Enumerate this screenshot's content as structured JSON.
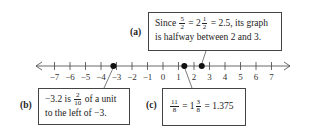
{
  "number_line": {
    "min": -7,
    "max": 7,
    "ticks": [
      "−7",
      "−6",
      "−5",
      "−4",
      "−3",
      "−2",
      "−1",
      "0",
      "1",
      "2",
      "3",
      "4",
      "5",
      "6",
      "7"
    ],
    "points": [
      {
        "id": "b",
        "value": -3.2
      },
      {
        "id": "c",
        "value": 1.375
      },
      {
        "id": "a",
        "value": 2.5
      }
    ]
  },
  "callouts": {
    "a": {
      "label": "(a)",
      "line1_pre": "Since",
      "frac1_num": "5",
      "frac1_den": "2",
      "eq1": "= 2",
      "frac2_num": "1",
      "frac2_den": "2",
      "line1_post": "= 2.5, its graph",
      "line2": "is halfway between 2 and 3."
    },
    "b": {
      "label": "(b)",
      "line1_pre": "−3.2 is",
      "frac_num": "2",
      "frac_den": "10",
      "line1_post": "of a unit",
      "line2": "to the left of −3."
    },
    "c": {
      "label": "(c)",
      "frac1_num": "11",
      "frac1_den": "8",
      "eq1": "= 1",
      "frac2_num": "3",
      "frac2_den": "8",
      "line1_post": "= 1.375"
    }
  }
}
